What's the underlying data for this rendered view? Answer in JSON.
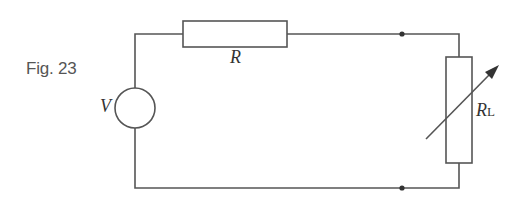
{
  "figure": {
    "label": "Fig. 23"
  },
  "components": {
    "voltage_source": {
      "symbol": "V"
    },
    "resistor": {
      "symbol": "R"
    },
    "load_resistor": {
      "symbol": "R",
      "subscript": "L",
      "variable": true
    }
  },
  "colors": {
    "line": "#555555",
    "text": "#333333"
  }
}
